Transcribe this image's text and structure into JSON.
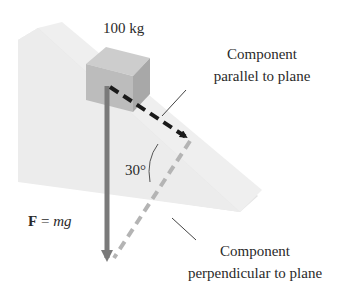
{
  "diagram": {
    "mass_label": "100 kg",
    "angle_label": "30°",
    "force_label": {
      "bold": "F",
      "equals": " = ",
      "italic": "mg"
    },
    "parallel_label": {
      "line1": "Component",
      "line2": "parallel to plane"
    },
    "perpendicular_label": {
      "line1": "Component",
      "line2": "perpendicular to plane"
    },
    "colors": {
      "ramp_side": "#e6e6e6",
      "ramp_top": "#efefef",
      "block_front": "#bdbdbd",
      "block_top": "#cfcfcf",
      "block_side": "#a9a9a9",
      "gravity_arrow": "#7a7a7a",
      "parallel_arrow": "#1a1a1a",
      "perpendicular_arrow": "#b4b4b4",
      "leader_line": "#444444"
    }
  }
}
